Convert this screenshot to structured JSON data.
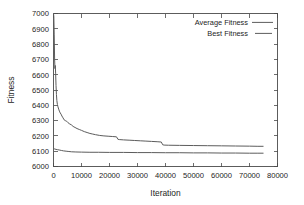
{
  "chart_data": {
    "type": "line",
    "title": "",
    "xlabel": "Iteration",
    "ylabel": "Fitness",
    "xlim": [
      0,
      80000
    ],
    "ylim": [
      6000,
      7000
    ],
    "xticks": [
      0,
      10000,
      20000,
      30000,
      40000,
      50000,
      60000,
      70000,
      80000
    ],
    "xtick_labels": [
      "0",
      "10000",
      "20000",
      "30000",
      "40000",
      "50000",
      "60000",
      "70000",
      "80000"
    ],
    "yticks": [
      6000,
      6100,
      6200,
      6300,
      6400,
      6500,
      6600,
      6700,
      6800,
      6900,
      7000
    ],
    "ytick_labels": [
      "6000",
      "6100",
      "6200",
      "6300",
      "6400",
      "6500",
      "6600",
      "6700",
      "6800",
      "6900",
      "7000"
    ],
    "grid": false,
    "legend_position": "top-right",
    "line_color": "#5c5c5c",
    "frame_color": "#4a4a4a",
    "series": [
      {
        "name": "Average Fitness",
        "style": "solid",
        "x": [
          0,
          120,
          260,
          400,
          520,
          640,
          760,
          900,
          1050,
          1200,
          1400,
          1600,
          1850,
          2100,
          2400,
          2700,
          3000,
          3400,
          3800,
          4200,
          4700,
          5200,
          5800,
          6400,
          7000,
          7700,
          8400,
          9200,
          10000,
          11000,
          12000,
          13000,
          14000,
          15000,
          16500,
          18000,
          19500,
          21000,
          22500,
          23000,
          23500,
          25000,
          27000,
          29000,
          31000,
          33000,
          35000,
          37000,
          38500,
          39000,
          39500,
          41000,
          45000,
          50000,
          55000,
          60000,
          65000,
          70000,
          73000,
          75000
        ],
        "y": [
          7000,
          6980,
          6860,
          6700,
          6640,
          6660,
          6610,
          6530,
          6470,
          6430,
          6405,
          6390,
          6375,
          6362,
          6350,
          6342,
          6330,
          6318,
          6305,
          6300,
          6296,
          6286,
          6278,
          6272,
          6262,
          6255,
          6248,
          6242,
          6236,
          6228,
          6222,
          6216,
          6212,
          6208,
          6203,
          6200,
          6198,
          6196,
          6194,
          6178,
          6176,
          6174,
          6172,
          6170,
          6168,
          6166,
          6164,
          6162,
          6160,
          6142,
          6140,
          6139,
          6138,
          6137,
          6136,
          6135,
          6134,
          6133,
          6132,
          6132
        ]
      },
      {
        "name": "Best Fitness",
        "style": "solid",
        "x": [
          0,
          200,
          500,
          900,
          1400,
          2000,
          2800,
          3600,
          4500,
          5500,
          6500,
          8000,
          10000,
          13000,
          16000,
          20000,
          25000,
          30000,
          35000,
          40000,
          45000,
          50000,
          55000,
          60000,
          65000,
          70000,
          73000,
          75000
        ],
        "y": [
          6118,
          6116,
          6114,
          6112,
          6110,
          6108,
          6105,
          6102,
          6100,
          6098,
          6096,
          6095,
          6094,
          6093,
          6093,
          6092,
          6092,
          6091,
          6091,
          6090,
          6090,
          6089,
          6089,
          6088,
          6088,
          6087,
          6087,
          6087
        ]
      }
    ]
  },
  "legend": {
    "items": [
      {
        "label": "Average Fitness"
      },
      {
        "label": "Best Fitness"
      }
    ]
  }
}
